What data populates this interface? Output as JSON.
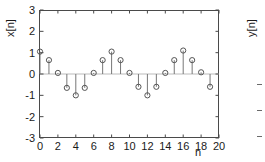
{
  "figure": {
    "left_plot": {
      "ylabel": "x[n]",
      "xlabel": "n"
    },
    "right_plot": {
      "ylabel": "y[n]"
    }
  },
  "chart_data": {
    "type": "scatter",
    "plot_style": "stem",
    "title": "",
    "xlabel": "n",
    "ylabel": "x[n]",
    "xlim": [
      0,
      20
    ],
    "ylim": [
      -3,
      3
    ],
    "xticks": [
      0,
      2,
      4,
      6,
      8,
      10,
      12,
      14,
      16,
      18,
      20
    ],
    "xtick_labels": [
      "0",
      "2",
      "4",
      "6",
      "8",
      "10",
      "12",
      "14",
      "16",
      "18",
      "20"
    ],
    "yticks": [
      3,
      2,
      1,
      0,
      -1,
      -2,
      -3
    ],
    "ytick_labels": [
      "3",
      "2",
      "1",
      "0",
      "-1",
      "-2",
      "-3"
    ],
    "grid": false,
    "legend": null,
    "marker": "open-circle",
    "x": [
      0,
      1,
      2,
      3,
      4,
      5,
      6,
      7,
      8,
      9,
      10,
      11,
      12,
      13,
      14,
      15,
      16,
      17,
      18,
      19
    ],
    "values": [
      1.05,
      0.65,
      0.05,
      -0.65,
      -1.0,
      -0.65,
      0.05,
      0.65,
      1.05,
      0.65,
      0.05,
      -0.6,
      -1.0,
      -0.6,
      0.05,
      0.65,
      1.1,
      0.65,
      0.08,
      -0.6
    ],
    "second_panel": {
      "ylabel": "y[n]",
      "note": "partially visible, clipped at right edge of screenshot"
    }
  },
  "colors": {
    "axis": "#4a4a4a",
    "marker": "#555555",
    "stem": "#777777",
    "baseline": "#bbbbbb",
    "text": "#1a1a1a",
    "background": "#ffffff"
  }
}
